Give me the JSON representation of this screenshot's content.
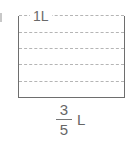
{
  "diagram": {
    "type": "measuring-container",
    "top_label": "1L",
    "division_count": 5,
    "dashed_lines": 5,
    "fraction": {
      "numerator": "3",
      "denominator": "5"
    },
    "unit": "L",
    "colors": {
      "outline": "#6e6e6e",
      "dashed": "#b5b5b5",
      "text": "#666666"
    }
  }
}
